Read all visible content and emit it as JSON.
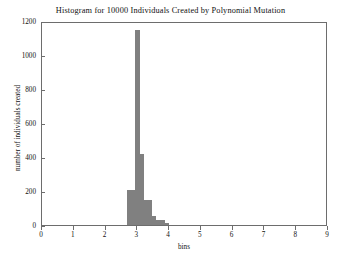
{
  "chart_data": {
    "type": "bar",
    "title": "Histogram for 10000 Individuals Created by Polynomial Mutation",
    "xlabel": "bins",
    "ylabel": "number of individuals created",
    "xlim": [
      0,
      9
    ],
    "ylim": [
      0,
      1200
    ],
    "grid": false,
    "legend": null,
    "bar_color": "#808080",
    "frame_color": "#6d6d6d",
    "xticks": [
      0,
      1,
      2,
      3,
      4,
      5,
      6,
      7,
      8,
      9
    ],
    "xtick_labels": [
      "0",
      "1",
      "2",
      "3",
      "4",
      "5",
      "6",
      "7",
      "8",
      "9"
    ],
    "yticks": [
      0,
      200,
      400,
      600,
      800,
      1000,
      1200
    ],
    "ytick_labels": [
      "0",
      "200",
      "400",
      "600",
      "800",
      "1000",
      "1200"
    ],
    "bin_edges": [
      2.67,
      2.8,
      2.93,
      3.07,
      3.2,
      3.33,
      3.47,
      3.6,
      3.73,
      3.87,
      4.0
    ],
    "categories": [
      "2.67",
      "2.80",
      "2.93",
      "3.07",
      "3.20",
      "3.33",
      "3.47",
      "3.60",
      "3.73",
      "3.87"
    ],
    "values": [
      205,
      205,
      1150,
      415,
      150,
      150,
      55,
      30,
      30,
      10
    ]
  },
  "figure": {
    "background": "#ffffff"
  }
}
